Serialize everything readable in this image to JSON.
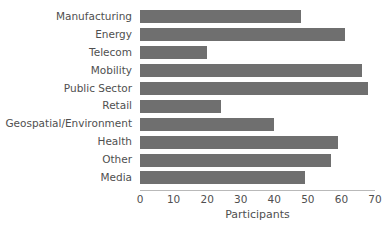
{
  "chart_data": {
    "type": "bar",
    "orientation": "horizontal",
    "title": "",
    "xlabel": "Participants",
    "ylabel": "",
    "categories": [
      "Manufacturing",
      "Energy",
      "Telecom",
      "Mobility",
      "Public Sector",
      "Retail",
      "Geospatial/Environment",
      "Health",
      "Other",
      "Media"
    ],
    "values": [
      48,
      61,
      20,
      66,
      68,
      24,
      40,
      59,
      57,
      49
    ],
    "xlim": [
      0,
      70
    ],
    "xticks": [
      0,
      10,
      20,
      30,
      40,
      50,
      60,
      70
    ],
    "xtick_labels": [
      "0",
      "10",
      "20",
      "30",
      "40",
      "50",
      "60",
      "70"
    ],
    "grid": false,
    "legend": null,
    "bar_color": "#6f6f6f",
    "background_color": "#ffffff",
    "axis_color": "#b9b9b9",
    "text_color": "#4f4f4f"
  }
}
